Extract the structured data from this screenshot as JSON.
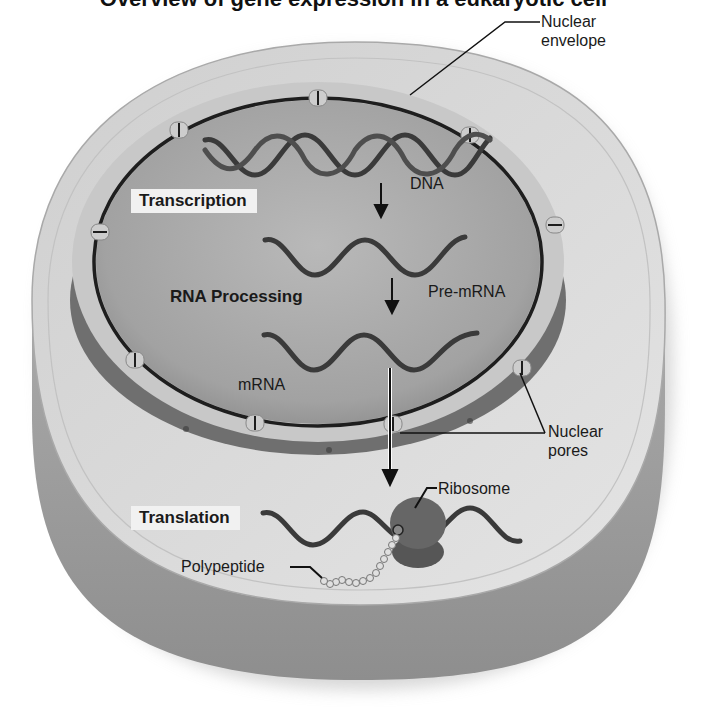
{
  "figure": {
    "title_cropped": "Overview of gene expression in a eukaryotic cell",
    "colors": {
      "background": "#ffffff",
      "cytoplasm": "#d9d9d9",
      "cytoplasm_side": "#9a9a9a",
      "nucleus_interior": "#a8a8a8",
      "nuclear_envelope": "#1e1e1e",
      "pore": "#c9c9c9",
      "strand": "#3a3a3a",
      "ribosome": "#5e5e5e",
      "label_box": "#f1f1f1",
      "text": "#1a1a1a"
    }
  },
  "labels": {
    "nuclear_envelope": [
      "Nuclear",
      "envelope"
    ],
    "dna": "DNA",
    "transcription": "Transcription",
    "rna_processing": "RNA Processing",
    "pre_mrna": "Pre-mRNA",
    "mrna": "mRNA",
    "nuclear_pores": [
      "Nuclear",
      "pores"
    ],
    "ribosome": "Ribosome",
    "translation": "Translation",
    "polypeptide": "Polypeptide"
  },
  "process_steps": [
    {
      "step": 1,
      "name": "Transcription",
      "input": "DNA",
      "output": "Pre-mRNA"
    },
    {
      "step": 2,
      "name": "RNA Processing",
      "input": "Pre-mRNA",
      "output": "mRNA"
    },
    {
      "step": 3,
      "name": "Translation",
      "input": "mRNA",
      "output": "Polypeptide"
    }
  ]
}
